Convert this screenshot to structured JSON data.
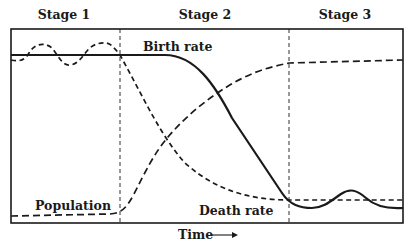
{
  "diagram": {
    "stages": [
      {
        "label": "Stage 1"
      },
      {
        "label": "Stage 2"
      },
      {
        "label": "Stage 3"
      }
    ],
    "curves": {
      "birth_rate": {
        "label": "Birth rate",
        "style": "solid"
      },
      "death_rate": {
        "label": "Death rate",
        "style": "dashed"
      },
      "population": {
        "label": "Population",
        "style": "dashed"
      }
    },
    "x_axis": {
      "label": "Time",
      "arrow": "right-arrow"
    },
    "colors": {
      "ink": "#1a1a1a",
      "background": "#ffffff"
    }
  }
}
